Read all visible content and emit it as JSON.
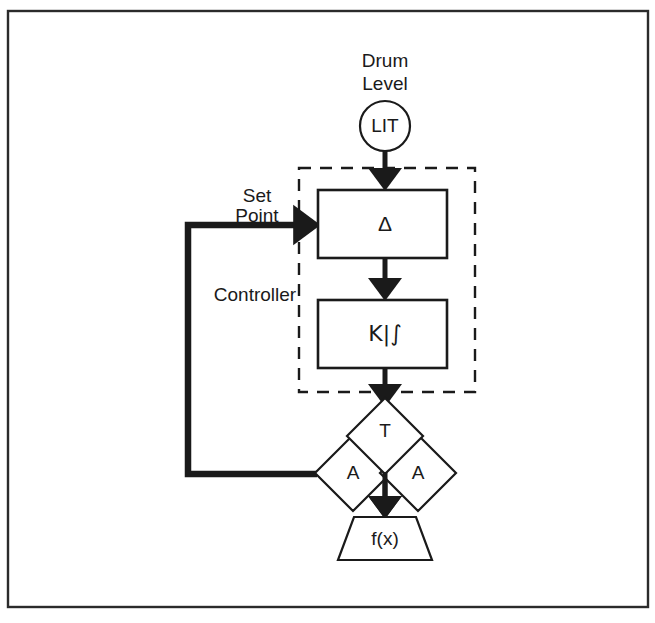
{
  "figure": {
    "background_color": "#ffffff",
    "line_color": "#1a1a1a",
    "frame_color": "#2b2b2b"
  },
  "labels": {
    "drum_level_line1": "Drum",
    "drum_level_line2": "Level",
    "set_point_line1": "Set",
    "set_point_line2": "Point",
    "controller": "Controller"
  },
  "nodes": {
    "transmitter": {
      "label": "LIT",
      "shape": "circle",
      "cx": 385,
      "cy": 126,
      "r": 25
    },
    "summer": {
      "label": "Δ",
      "shape": "rect",
      "x": 318,
      "y": 190,
      "w": 129,
      "h": 68
    },
    "controller_block": {
      "label": "K|∫",
      "shape": "rect",
      "x": 318,
      "y": 300,
      "w": 129,
      "h": 68
    },
    "diamond_top": {
      "label": "T",
      "shape": "diamond",
      "cx": 385,
      "cy": 436,
      "half": 38
    },
    "diamond_left": {
      "label": "A",
      "shape": "diamond",
      "cx": 353,
      "cy": 473,
      "half": 38
    },
    "diamond_right": {
      "label": "A",
      "shape": "diamond",
      "cx": 418,
      "cy": 473,
      "half": 38
    },
    "function_block": {
      "label": "f(x)",
      "shape": "trapezoid",
      "cx": 385,
      "top_y": 517,
      "bottom_y": 560,
      "top_w": 62,
      "bottom_w": 94
    }
  },
  "groups": {
    "controller_boundary": {
      "name": "Controller",
      "style": "dashed",
      "x": 299,
      "y": 168,
      "w": 176,
      "h": 224
    },
    "outer_frame": {
      "x": 8,
      "y": 11,
      "w": 640,
      "h": 596
    }
  },
  "connections": [
    {
      "name": "transmitter-to-summer",
      "from": "transmitter",
      "to": "summer",
      "style": "arrow"
    },
    {
      "name": "summer-to-controller",
      "from": "summer",
      "to": "controller_block",
      "style": "arrow"
    },
    {
      "name": "controller-to-diamonds",
      "from": "controller_block",
      "to": "diamond_top",
      "style": "arrow"
    },
    {
      "name": "diamonds-to-function",
      "from": "diamond_top",
      "to": "function_block",
      "style": "arrow"
    },
    {
      "name": "feedback-setpoint",
      "from": "diamond_left",
      "to": "summer",
      "style": "thick-arrow"
    }
  ]
}
